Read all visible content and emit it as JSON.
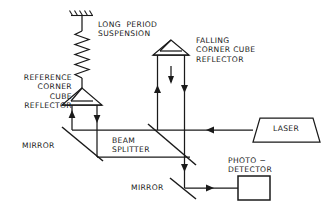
{
  "figure": {
    "type": "optical-interferometer-schematic",
    "background_color": "#ffffff",
    "line_color": "#1a1a1a",
    "text_color": "#1a1a1a"
  },
  "labels": {
    "long_period_suspension": "LONG  PERIOD\nSUSPENSION",
    "falling_corner_cube_reflector": "FALLING\nCORNER CUBE\nREFLECTOR",
    "reference_corner_cube_reflector": "REFERENCE\nCORNER\nCUBE\nREFLECTOR",
    "mirror_left": "MIRROR",
    "beam_splitter": "BEAM\nSPLITTER",
    "laser": "LASER",
    "mirror_bottom": "MIRROR",
    "photo_detector": "PHOTO −\nDETECTOR"
  },
  "components": {
    "ceiling_anchor": {
      "name": "ceiling-hatching",
      "hatch_strokes": 5
    },
    "spring": {
      "name": "long-period-spring",
      "coils": 9
    },
    "reference_cube": {
      "name": "reference-corner-cube-prism"
    },
    "falling_cube": {
      "name": "falling-corner-cube-prism"
    },
    "laser_source": {
      "name": "laser-trapezoid"
    },
    "detector_box": {
      "name": "photodetector-rectangle"
    },
    "mirror_upper_left": {
      "name": "mirror-diagonal-upper-left"
    },
    "mirror_lower": {
      "name": "mirror-diagonal-lower"
    },
    "splitter": {
      "name": "beam-splitter-diagonal"
    }
  },
  "beams": {
    "laser_to_splitter": "leftward",
    "splitter_to_reference_down": "upward-then-down",
    "falling_cube_drop": "downward",
    "splitter_to_detector": "rightward"
  }
}
